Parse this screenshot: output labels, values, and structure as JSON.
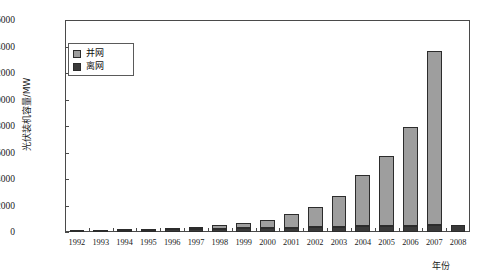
{
  "chart_data": {
    "type": "bar",
    "stacked": true,
    "title": "",
    "xlabel": "年份",
    "ylabel": "光伏装机容量/MW",
    "ylim": [
      0,
      16000
    ],
    "ytick_step": 2000,
    "yticks": [
      "0",
      "2000",
      "4000",
      "6000",
      "8000",
      "10000",
      "12000",
      "14000",
      "16000"
    ],
    "grid": false,
    "legend_position": "top-left",
    "categories": [
      "1992",
      "1993",
      "1994",
      "1995",
      "1996",
      "1997",
      "1998",
      "1999",
      "2000",
      "2001",
      "2002",
      "2003",
      "2004",
      "2005",
      "2006",
      "2007",
      "2008"
    ],
    "series": [
      {
        "name": "离网",
        "color": "#3a3a3a",
        "values": [
          105,
          130,
          150,
          170,
          190,
          215,
          240,
          270,
          300,
          330,
          360,
          390,
          420,
          450,
          470,
          490,
          510
        ]
      },
      {
        "name": "并网",
        "color": "#9e9e9e",
        "values": [
          20,
          30,
          45,
          80,
          120,
          180,
          270,
          400,
          620,
          1000,
          1550,
          2300,
          3850,
          5300,
          7450,
          13200,
          0
        ]
      }
    ],
    "totals": [
      125,
      160,
      195,
      250,
      310,
      395,
      510,
      670,
      920,
      1330,
      1910,
      2690,
      4270,
      5750,
      7920,
      13710,
      510
    ]
  },
  "legend": {
    "items": [
      {
        "label": "并网",
        "color": "#9e9e9e"
      },
      {
        "label": "离网",
        "color": "#3a3a3a"
      }
    ]
  },
  "axes": {
    "y_title": "光伏装机容量/MW",
    "x_title": "年份"
  }
}
